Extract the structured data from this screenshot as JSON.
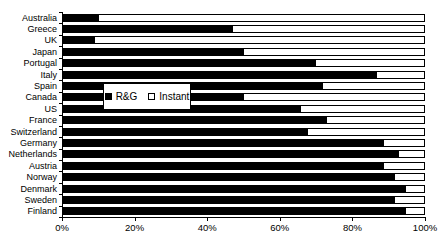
{
  "chart_data": {
    "type": "bar",
    "orientation": "horizontal",
    "stacked": true,
    "title": "",
    "categories": [
      "Australia",
      "Greece",
      "UK",
      "Japan",
      "Portugal",
      "Italy",
      "Spain",
      "Canada",
      "US",
      "France",
      "Switzerland",
      "Germany",
      "Netherlands",
      "Austria",
      "Norway",
      "Denmark",
      "Sweden",
      "Finland"
    ],
    "series": [
      {
        "name": "R&G",
        "color": "#000000",
        "values": [
          10,
          47,
          9,
          50,
          70,
          87,
          72,
          50,
          66,
          73,
          68,
          89,
          93,
          89,
          92,
          95,
          92,
          95
        ]
      },
      {
        "name": "Instant",
        "color": "#ffffff",
        "values": [
          90,
          53,
          91,
          50,
          30,
          13,
          28,
          50,
          34,
          27,
          32,
          11,
          7,
          11,
          8,
          5,
          8,
          5
        ]
      }
    ],
    "xlim": [
      0,
      100
    ],
    "x_tick_values": [
      0,
      20,
      40,
      60,
      80,
      100
    ],
    "x_tick_labels": [
      "0%",
      "20%",
      "40%",
      "60%",
      "80%",
      "100%"
    ],
    "ylabel": "",
    "xlabel": "",
    "grid": false,
    "legend_position": "inside-middle-left"
  },
  "colors": {
    "rg_fill": "#000000",
    "instant_fill": "#ffffff",
    "outline": "#000000",
    "background": "#ffffff"
  }
}
